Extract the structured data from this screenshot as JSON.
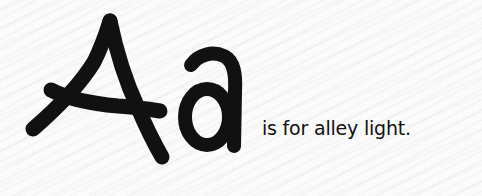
{
  "card": {
    "uppercase_letter": "A",
    "lowercase_letter": "a",
    "caption": "is for alley light.",
    "ink_color": "#111111",
    "background_color": "#fbfbfb"
  }
}
